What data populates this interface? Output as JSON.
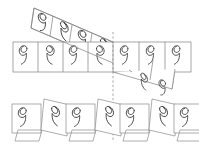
{
  "figure": {
    "background_color": "#ffffff",
    "outline_color": "#808080",
    "glyph_color": "#2b2b2b",
    "dashed_axis_color": "#909090",
    "glyph_name": "comma-spiral-glyph",
    "reflection_axis": {
      "name": "vertical-mirror-axis",
      "x": 113,
      "y_top": 32,
      "y_bottom": 142,
      "style": "dashed"
    },
    "bands": [
      {
        "id": "slanted-band",
        "shape": "parallelogram",
        "orientation": "descending",
        "points": "34,8 175,69 172,89 31,28",
        "glyph_count": 7,
        "glyph_orientation": "upright-sheared"
      },
      {
        "id": "horizontal-band",
        "shape": "rectangle",
        "orientation": "horizontal",
        "x": 13,
        "y": 42,
        "width": 178,
        "height": 30,
        "glyph_count": 7,
        "glyph_orientation": "upright"
      }
    ],
    "bottom_row": {
      "id": "decomposed-cells-row",
      "y": 101,
      "cell_size": 30,
      "groups": [
        {
          "id": "group-1",
          "cells": [
            {
              "kind": "square",
              "glyph": "comma",
              "mirrored": false
            },
            {
              "kind": "parallelogram",
              "glyph": "none",
              "mirrored": false
            }
          ]
        },
        {
          "id": "group-2",
          "cells": [
            {
              "kind": "parallelogram",
              "glyph": "comma",
              "mirrored": true
            },
            {
              "kind": "square",
              "glyph": "comma",
              "mirrored": false
            }
          ]
        },
        {
          "id": "group-3",
          "cells": [
            {
              "kind": "parallelogram",
              "glyph": "comma",
              "mirrored": true
            },
            {
              "kind": "square",
              "glyph": "comma",
              "mirrored": false
            }
          ]
        },
        {
          "id": "group-4",
          "cells": [
            {
              "kind": "parallelogram",
              "glyph": "comma",
              "mirrored": true
            },
            {
              "kind": "square",
              "glyph": "comma",
              "mirrored": false
            }
          ]
        }
      ]
    }
  }
}
